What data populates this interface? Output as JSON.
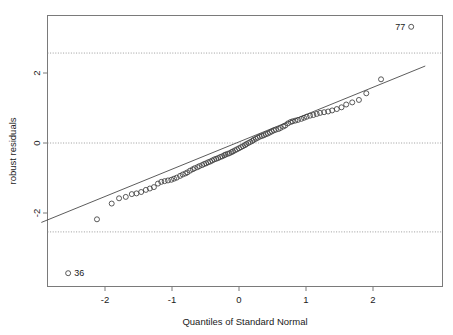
{
  "chart_data": {
    "type": "scatter",
    "title": "",
    "xlabel": "Quantiles of Standard Normal",
    "ylabel": "robust residuals",
    "xlim": [
      -2.95,
      2.95
    ],
    "ylim": [
      -3.9,
      3.65
    ],
    "xticks": [
      -2,
      -1,
      0,
      1,
      2
    ],
    "xtick_labels": [
      "-2",
      "-1",
      "0",
      "1",
      "2"
    ],
    "yticks": [
      2,
      0,
      -2
    ],
    "ytick_labels": [
      "2",
      "0",
      "-2"
    ],
    "grid": false,
    "reference_lines": [
      {
        "name": "upper-threshold",
        "y": 2.57,
        "style": "dotted"
      },
      {
        "name": "zero-line",
        "y": 0.0,
        "style": "dotted"
      },
      {
        "name": "lower-threshold",
        "y": -2.54,
        "style": "dotted"
      }
    ],
    "fit_line": {
      "name": "qq-reference-line",
      "x": [
        -2.95,
        2.78
      ],
      "y": [
        -2.27,
        2.2
      ]
    },
    "point_labels": [
      {
        "label": "77",
        "x": 2.57,
        "y": 3.32,
        "text_side": "left"
      },
      {
        "label": "36",
        "x": -2.55,
        "y": -3.72,
        "text_side": "right"
      }
    ],
    "points": [
      {
        "x": -2.55,
        "y": -3.72
      },
      {
        "x": -2.12,
        "y": -2.18
      },
      {
        "x": -1.9,
        "y": -1.73
      },
      {
        "x": -1.79,
        "y": -1.58
      },
      {
        "x": -1.69,
        "y": -1.54
      },
      {
        "x": -1.6,
        "y": -1.46
      },
      {
        "x": -1.53,
        "y": -1.44
      },
      {
        "x": -1.46,
        "y": -1.4
      },
      {
        "x": -1.39,
        "y": -1.34
      },
      {
        "x": -1.33,
        "y": -1.3
      },
      {
        "x": -1.27,
        "y": -1.26
      },
      {
        "x": -1.21,
        "y": -1.16
      },
      {
        "x": -1.16,
        "y": -1.11
      },
      {
        "x": -1.11,
        "y": -1.09
      },
      {
        "x": -1.06,
        "y": -1.07
      },
      {
        "x": -1.01,
        "y": -1.05
      },
      {
        "x": -0.97,
        "y": -1.02
      },
      {
        "x": -0.93,
        "y": -0.99
      },
      {
        "x": -0.88,
        "y": -0.94
      },
      {
        "x": -0.84,
        "y": -0.9
      },
      {
        "x": -0.8,
        "y": -0.87
      },
      {
        "x": -0.77,
        "y": -0.84
      },
      {
        "x": -0.73,
        "y": -0.79
      },
      {
        "x": -0.69,
        "y": -0.75
      },
      {
        "x": -0.66,
        "y": -0.72
      },
      {
        "x": -0.62,
        "y": -0.69
      },
      {
        "x": -0.59,
        "y": -0.66
      },
      {
        "x": -0.55,
        "y": -0.63
      },
      {
        "x": -0.52,
        "y": -0.6
      },
      {
        "x": -0.49,
        "y": -0.58
      },
      {
        "x": -0.46,
        "y": -0.55
      },
      {
        "x": -0.43,
        "y": -0.53
      },
      {
        "x": -0.4,
        "y": -0.5
      },
      {
        "x": -0.37,
        "y": -0.47
      },
      {
        "x": -0.34,
        "y": -0.45
      },
      {
        "x": -0.31,
        "y": -0.43
      },
      {
        "x": -0.28,
        "y": -0.4
      },
      {
        "x": -0.25,
        "y": -0.38
      },
      {
        "x": -0.22,
        "y": -0.35
      },
      {
        "x": -0.2,
        "y": -0.33
      },
      {
        "x": -0.17,
        "y": -0.31
      },
      {
        "x": -0.14,
        "y": -0.29
      },
      {
        "x": -0.11,
        "y": -0.26
      },
      {
        "x": -0.09,
        "y": -0.24
      },
      {
        "x": -0.06,
        "y": -0.21
      },
      {
        "x": -0.03,
        "y": -0.18
      },
      {
        "x": 0.0,
        "y": -0.15
      },
      {
        "x": 0.03,
        "y": -0.12
      },
      {
        "x": 0.06,
        "y": -0.09
      },
      {
        "x": 0.09,
        "y": -0.06
      },
      {
        "x": 0.11,
        "y": -0.03
      },
      {
        "x": 0.14,
        "y": 0.0
      },
      {
        "x": 0.17,
        "y": 0.03
      },
      {
        "x": 0.2,
        "y": 0.06
      },
      {
        "x": 0.22,
        "y": 0.09
      },
      {
        "x": 0.25,
        "y": 0.12
      },
      {
        "x": 0.28,
        "y": 0.15
      },
      {
        "x": 0.31,
        "y": 0.18
      },
      {
        "x": 0.34,
        "y": 0.2
      },
      {
        "x": 0.37,
        "y": 0.22
      },
      {
        "x": 0.4,
        "y": 0.25
      },
      {
        "x": 0.43,
        "y": 0.27
      },
      {
        "x": 0.46,
        "y": 0.3
      },
      {
        "x": 0.49,
        "y": 0.33
      },
      {
        "x": 0.52,
        "y": 0.36
      },
      {
        "x": 0.55,
        "y": 0.38
      },
      {
        "x": 0.59,
        "y": 0.4
      },
      {
        "x": 0.62,
        "y": 0.43
      },
      {
        "x": 0.66,
        "y": 0.47
      },
      {
        "x": 0.69,
        "y": 0.5
      },
      {
        "x": 0.73,
        "y": 0.56
      },
      {
        "x": 0.77,
        "y": 0.6
      },
      {
        "x": 0.8,
        "y": 0.62
      },
      {
        "x": 0.84,
        "y": 0.64
      },
      {
        "x": 0.88,
        "y": 0.66
      },
      {
        "x": 0.93,
        "y": 0.69
      },
      {
        "x": 0.97,
        "y": 0.72
      },
      {
        "x": 1.01,
        "y": 0.75
      },
      {
        "x": 1.06,
        "y": 0.78
      },
      {
        "x": 1.11,
        "y": 0.8
      },
      {
        "x": 1.16,
        "y": 0.83
      },
      {
        "x": 1.21,
        "y": 0.86
      },
      {
        "x": 1.27,
        "y": 0.88
      },
      {
        "x": 1.33,
        "y": 0.9
      },
      {
        "x": 1.39,
        "y": 0.93
      },
      {
        "x": 1.46,
        "y": 0.97
      },
      {
        "x": 1.53,
        "y": 1.02
      },
      {
        "x": 1.6,
        "y": 1.1
      },
      {
        "x": 1.69,
        "y": 1.16
      },
      {
        "x": 1.79,
        "y": 1.23
      },
      {
        "x": 1.9,
        "y": 1.42
      },
      {
        "x": 2.12,
        "y": 1.82
      },
      {
        "x": 2.57,
        "y": 3.32
      }
    ]
  }
}
